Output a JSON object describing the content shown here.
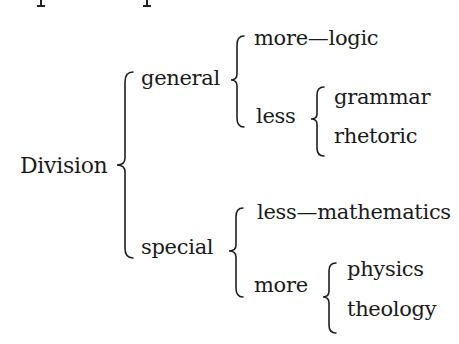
{
  "diagram": {
    "type": "brace-tree",
    "root": {
      "label": "Division",
      "children": [
        {
          "label": "general",
          "children": [
            {
              "label": "more—logic"
            },
            {
              "label": "less",
              "children": [
                {
                  "label": "grammar"
                },
                {
                  "label": "rhetoric"
                }
              ]
            }
          ]
        },
        {
          "label": "special",
          "children": [
            {
              "label": "less—mathematics"
            },
            {
              "label": "more",
              "children": [
                {
                  "label": "physics"
                },
                {
                  "label": "theology"
                }
              ]
            }
          ]
        }
      ]
    },
    "text_color": "#1b1b1b",
    "background": "#ffffff"
  }
}
